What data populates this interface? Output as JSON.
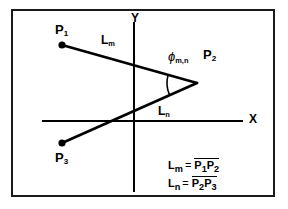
{
  "figure": {
    "type": "geometry-diagram",
    "background": "#ffffff",
    "ink_color": "#000000",
    "frame": {
      "border_color": "#1a1a1a"
    },
    "axes": {
      "x_label": "X",
      "y_label": "Y",
      "origin": {
        "x": 134,
        "y": 121
      },
      "x_extent": {
        "from": 42,
        "to": 243
      },
      "y_extent": {
        "from": 22,
        "to": 192
      }
    },
    "points": [
      {
        "id": "p1",
        "base": "P",
        "sub": "1",
        "x": 62,
        "y": 45,
        "label_dx": -6,
        "label_dy": -22
      },
      {
        "id": "p2",
        "base": "P",
        "sub": "2",
        "x": 197,
        "y": 83,
        "label_dx": 6,
        "label_dy": -32
      },
      {
        "id": "p3",
        "base": "P",
        "sub": "3",
        "x": 62,
        "y": 143,
        "label_dx": -6,
        "label_dy": 8
      }
    ],
    "segments": [
      {
        "id": "lm",
        "base": "L",
        "sub": "m",
        "from": "p1",
        "to": "p2",
        "label_x": 101,
        "label_y": 34
      },
      {
        "id": "ln",
        "base": "L",
        "sub": "n",
        "from": "p2",
        "to": "p3",
        "label_x": 158,
        "label_y": 105
      }
    ],
    "angle": {
      "glyph": "ϕ",
      "sub": "m,n",
      "label_x": 168,
      "label_y": 51,
      "vertex": "p2"
    },
    "legend": [
      {
        "lhs_base": "L",
        "lhs_sub": "m",
        "eq": "=",
        "rhs": [
          {
            "base": "P",
            "sub": "1"
          },
          {
            "base": "P",
            "sub": "2"
          }
        ]
      },
      {
        "lhs_base": "L",
        "lhs_sub": "n",
        "eq": "=",
        "rhs": [
          {
            "base": "P",
            "sub": "2"
          },
          {
            "base": "P",
            "sub": "3"
          }
        ]
      }
    ]
  },
  "chart_data": {
    "type": "scatter",
    "title": "",
    "xlabel": "X",
    "ylabel": "Y",
    "grid": false,
    "legend_position": "bottom-right",
    "annotations": [
      "L_m = P1P2",
      "L_n = P2P3",
      "phi_m,n"
    ],
    "series": [
      {
        "name": "polyline P1-P2-P3",
        "points": [
          {
            "label": "P1",
            "px": 62,
            "py": 45
          },
          {
            "label": "P2",
            "px": 197,
            "py": 83
          },
          {
            "label": "P3",
            "px": 62,
            "py": 143
          }
        ]
      }
    ]
  }
}
